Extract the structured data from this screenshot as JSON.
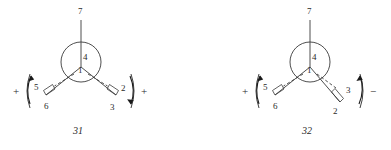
{
  "figure": {
    "background_color": "#ffffff",
    "line_color": "#3a3a3a",
    "text_color": "#2a2a2a",
    "structures": [
      {
        "id": "structure-31",
        "caption": "31",
        "left_sign": "+",
        "right_sign": "+",
        "atom_labels": {
          "top": "7",
          "center_upper": "4",
          "center_lower": "1",
          "left_dash": "5",
          "left_wedge": "6",
          "right_upper": "2",
          "right_lower": "3"
        }
      },
      {
        "id": "structure-32",
        "caption": "32",
        "left_sign": "+",
        "right_sign": "−",
        "atom_labels": {
          "top": "7",
          "center_upper": "4",
          "center_lower": "1",
          "left_dash": "5",
          "left_wedge": "6",
          "right_upper": "3",
          "right_lower": "2"
        }
      }
    ]
  }
}
